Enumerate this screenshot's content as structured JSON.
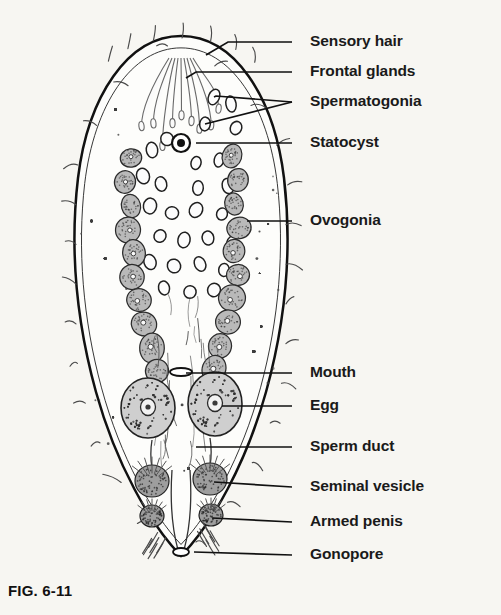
{
  "figure": {
    "caption": "FIG. 6-11",
    "background_color": "#f7f6f2",
    "ink_color": "#1a1a1a"
  },
  "labels": [
    {
      "id": "sensory-hair",
      "text": "Sensory hair",
      "text_x": 310,
      "text_y": 42,
      "leader": [
        [
          292,
          42
        ],
        [
          228,
          42
        ],
        [
          206,
          55
        ]
      ]
    },
    {
      "id": "frontal-glands",
      "text": "Frontal glands",
      "text_x": 310,
      "text_y": 72,
      "leader": [
        [
          292,
          72
        ],
        [
          196,
          72
        ],
        [
          186,
          78
        ]
      ]
    },
    {
      "id": "spermatogonia",
      "text": "Spermatogonia",
      "text_x": 310,
      "text_y": 102,
      "leader": [
        [
          292,
          102
        ],
        [
          216,
          96
        ],
        [
          214,
          97
        ]
      ]
    },
    {
      "id": "spermatogonia-2",
      "text": "",
      "text_x": 0,
      "text_y": 0,
      "leader": [
        [
          292,
          102
        ],
        [
          205,
          124
        ]
      ]
    },
    {
      "id": "statocyst",
      "text": "Statocyst",
      "text_x": 310,
      "text_y": 143,
      "leader": [
        [
          292,
          143
        ],
        [
          196,
          143
        ]
      ]
    },
    {
      "id": "ovogonia",
      "text": "Ovogonia",
      "text_x": 310,
      "text_y": 221,
      "leader": [
        [
          292,
          221
        ],
        [
          247,
          221
        ]
      ]
    },
    {
      "id": "mouth",
      "text": "Mouth",
      "text_x": 310,
      "text_y": 373,
      "leader": [
        [
          292,
          373
        ],
        [
          186,
          373
        ]
      ]
    },
    {
      "id": "egg",
      "text": "Egg",
      "text_x": 310,
      "text_y": 406,
      "leader": [
        [
          292,
          406
        ],
        [
          222,
          406
        ]
      ]
    },
    {
      "id": "sperm-duct",
      "text": "Sperm duct",
      "text_x": 310,
      "text_y": 447,
      "leader": [
        [
          292,
          447
        ],
        [
          196,
          447
        ]
      ]
    },
    {
      "id": "seminal-vesicle",
      "text": "Seminal vesicle",
      "text_x": 310,
      "text_y": 487,
      "leader": [
        [
          292,
          487
        ],
        [
          214,
          482
        ]
      ]
    },
    {
      "id": "armed-penis",
      "text": "Armed penis",
      "text_x": 310,
      "text_y": 522,
      "leader": [
        [
          292,
          522
        ],
        [
          212,
          518
        ]
      ]
    },
    {
      "id": "gonopore",
      "text": "Gonopore",
      "text_x": 310,
      "text_y": 555,
      "leader": [
        [
          292,
          555
        ],
        [
          194,
          552
        ]
      ]
    }
  ],
  "anatomy": {
    "body": {
      "name": "body-outline",
      "path": "M 181 36 C 128 36 88 96 78 178 C 70 246 76 320 96 392 C 116 464 150 524 181 556 C 212 524 246 464 266 392 C 286 320 292 246 284 178 C 274 96 234 36 181 36 Z"
    },
    "statocyst": {
      "cx": 181,
      "cy": 143,
      "r_outer": 9,
      "r_inner": 4
    },
    "mouth": {
      "cx": 181,
      "cy": 372,
      "rx": 11,
      "ry": 4
    },
    "gonopore": {
      "cx": 181,
      "cy": 552,
      "rx": 8,
      "ry": 4
    },
    "eggs": [
      {
        "cx": 148,
        "cy": 408,
        "rx": 27,
        "ry": 30
      },
      {
        "cx": 215,
        "cy": 404,
        "rx": 27,
        "ry": 32
      }
    ],
    "ovogonia_left": [
      [
        131,
        158
      ],
      [
        125,
        182
      ],
      [
        131,
        206
      ],
      [
        128,
        230
      ],
      [
        134,
        253
      ],
      [
        132,
        277
      ],
      [
        139,
        300
      ],
      [
        144,
        324
      ],
      [
        152,
        348
      ],
      [
        157,
        371
      ]
    ],
    "ovogonia_right": [
      [
        232,
        156
      ],
      [
        238,
        180
      ],
      [
        234,
        204
      ],
      [
        239,
        228
      ],
      [
        234,
        251
      ],
      [
        238,
        275
      ],
      [
        232,
        298
      ],
      [
        228,
        322
      ],
      [
        220,
        346
      ],
      [
        214,
        369
      ]
    ],
    "spermatogonia": [
      [
        214,
        97
      ],
      [
        231,
        104
      ],
      [
        205,
        124
      ],
      [
        236,
        128
      ],
      [
        152,
        150
      ],
      [
        167,
        139
      ],
      [
        196,
        163
      ],
      [
        219,
        160
      ],
      [
        143,
        176
      ],
      [
        161,
        184
      ],
      [
        198,
        188
      ],
      [
        228,
        186
      ],
      [
        150,
        206
      ],
      [
        172,
        213
      ],
      [
        196,
        210
      ],
      [
        222,
        214
      ],
      [
        160,
        236
      ],
      [
        184,
        240
      ],
      [
        208,
        238
      ],
      [
        232,
        243
      ],
      [
        150,
        262
      ],
      [
        174,
        266
      ],
      [
        200,
        264
      ],
      [
        224,
        270
      ],
      [
        164,
        288
      ],
      [
        190,
        292
      ],
      [
        214,
        290
      ],
      [
        238,
        296
      ]
    ],
    "seminal_vesicles": [
      {
        "cx": 152,
        "cy": 481,
        "rx": 17,
        "ry": 16
      },
      {
        "cx": 210,
        "cy": 479,
        "rx": 17,
        "ry": 16
      }
    ],
    "penes": [
      {
        "cx": 152,
        "cy": 516,
        "rx": 12,
        "ry": 11
      },
      {
        "cx": 211,
        "cy": 515,
        "rx": 12,
        "ry": 11
      }
    ],
    "frontal_glands_count": 9,
    "sensory_hairs_count": 26
  }
}
